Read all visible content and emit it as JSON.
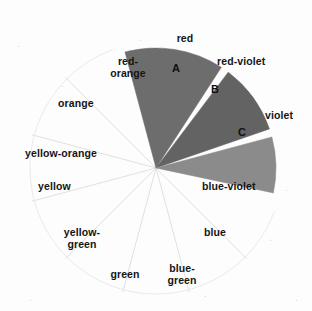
{
  "figure": {
    "background_color": "#fdfdfd",
    "center": {
      "x": 156,
      "y": 168
    },
    "radius": 120
  },
  "chart_data": {
    "type": "pie",
    "title": "",
    "subtitle": "",
    "xlabel": "",
    "ylabel": "",
    "legend_position": "none",
    "grid": false,
    "categories": [
      "red",
      "red-violet",
      "violet",
      "blue-violet",
      "blue",
      "blue-green",
      "green",
      "yellow-green",
      "yellow",
      "yellow-orange",
      "orange",
      "red-orange"
    ],
    "values": [
      30,
      30,
      30,
      30,
      30,
      30,
      30,
      30,
      30,
      30,
      30,
      30
    ],
    "slice_degrees": 30,
    "highlighted": [
      {
        "letter": "A",
        "spans": [
          "red-orange",
          "red"
        ],
        "start_angle_deg": -105,
        "end_angle_deg": -57,
        "fill": "#6d6d6d"
      },
      {
        "letter": "B",
        "spans": [
          "red-violet"
        ],
        "start_angle_deg": -53,
        "end_angle_deg": -19,
        "fill": "#636363"
      },
      {
        "letter": "C",
        "spans": [
          "violet",
          "blue-violet"
        ],
        "start_angle_deg": -15,
        "end_angle_deg": 12,
        "fill": "#8b8b8b"
      }
    ]
  },
  "labels": [
    {
      "id": "red",
      "text": "red",
      "x": 160,
      "y": 33,
      "w": 50,
      "align": "center"
    },
    {
      "id": "red-violet",
      "text": "red-violet",
      "x": 217,
      "y": 56,
      "w": 72,
      "align": "left"
    },
    {
      "id": "violet",
      "text": "violet",
      "x": 265,
      "y": 110,
      "w": 44,
      "align": "left"
    },
    {
      "id": "blue-violet",
      "text": "blue-violet",
      "x": 202,
      "y": 181,
      "w": 78,
      "align": "left"
    },
    {
      "id": "blue",
      "text": "blue",
      "x": 204,
      "y": 227,
      "w": 36,
      "align": "left"
    },
    {
      "id": "blue-green",
      "text": "blue-\ngreen",
      "x": 160,
      "y": 263,
      "w": 44,
      "align": "center"
    },
    {
      "id": "green",
      "text": "green",
      "x": 104,
      "y": 269,
      "w": 42,
      "align": "center"
    },
    {
      "id": "yellow-green",
      "text": "yellow-\ngreen",
      "x": 54,
      "y": 227,
      "w": 56,
      "align": "center"
    },
    {
      "id": "yellow",
      "text": "yellow",
      "x": 38,
      "y": 181,
      "w": 46,
      "align": "left"
    },
    {
      "id": "yellow-orange",
      "text": "yellow-orange",
      "x": 25,
      "y": 148,
      "w": 92,
      "align": "left"
    },
    {
      "id": "orange",
      "text": "orange",
      "x": 58,
      "y": 98,
      "w": 50,
      "align": "left"
    },
    {
      "id": "red-orange",
      "text": "red-\norange",
      "x": 104,
      "y": 56,
      "w": 48,
      "align": "center"
    }
  ],
  "wedge_letters": [
    {
      "id": "A",
      "text": "A",
      "x": 172,
      "y": 63
    },
    {
      "id": "B",
      "text": "B",
      "x": 211,
      "y": 84
    },
    {
      "id": "C",
      "text": "C",
      "x": 238,
      "y": 127
    }
  ],
  "colors": {
    "wedge_a": "#6d6d6d",
    "wedge_b": "#636363",
    "wedge_c": "#8b8b8b",
    "spoke_line": "#dcdcdc",
    "gap": "#ffffff",
    "text": "#151515",
    "background": "#fdfdfd"
  }
}
